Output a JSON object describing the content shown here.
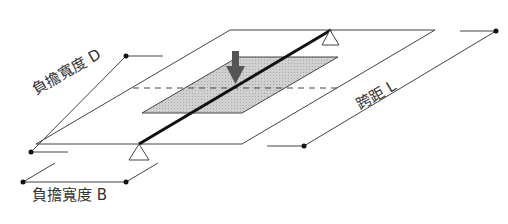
{
  "diagram": {
    "type": "structural-load-diagram",
    "labels": {
      "load_width_d": "負擔寬度 D",
      "span_l": "跨距 L",
      "load_width_b": "負擔寬度 B"
    },
    "colors": {
      "line": "#333333",
      "beam": "#111111",
      "load_area_fill": "#c8c8c8",
      "load_arrow": "#555555",
      "support_fill": "#ffffff",
      "background": "#ffffff"
    }
  }
}
